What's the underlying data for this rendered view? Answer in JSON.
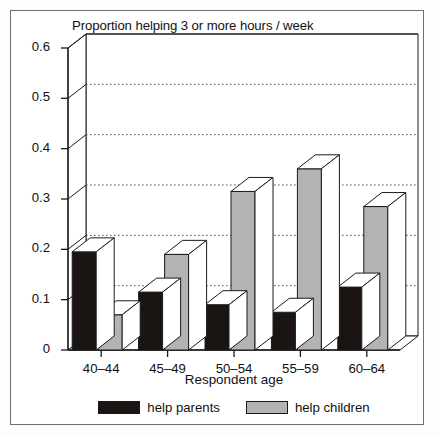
{
  "chart_data": {
    "type": "bar",
    "title": "Proportion helping 3 or more hours / week",
    "xlabel": "Respondent age",
    "ylabel": "",
    "categories": [
      "40–44",
      "45–49",
      "50–54",
      "55–59",
      "60–64"
    ],
    "series": [
      {
        "name": "help parents",
        "color": "#1a1512",
        "values": [
          0.195,
          0.115,
          0.09,
          0.075,
          0.125
        ]
      },
      {
        "name": "help children",
        "color": "#b3b3b3",
        "values": [
          0.07,
          0.19,
          0.315,
          0.36,
          0.285
        ]
      }
    ],
    "ylim": [
      0,
      0.6
    ],
    "yticks": [
      0,
      0.1,
      0.2,
      0.3,
      0.4,
      0.5,
      0.6
    ],
    "ytick_labels": [
      "0",
      "0.1",
      "0.2",
      "0.3",
      "0.4",
      "0.5",
      "0.6"
    ],
    "grid": true,
    "grid_style": "dotted",
    "legend_position": "bottom",
    "style": "3d-bar"
  },
  "legend": {
    "items": [
      {
        "label": "help parents",
        "color": "#1a1512"
      },
      {
        "label": "help children",
        "color": "#b3b3b3"
      }
    ]
  },
  "colors": {
    "bar_parents": "#1a1512",
    "bar_children": "#b3b3b3",
    "bar_top": "#ffffff",
    "axis": "#1a1a1a",
    "grid": "#555555",
    "frame": "#6e6e6e"
  }
}
